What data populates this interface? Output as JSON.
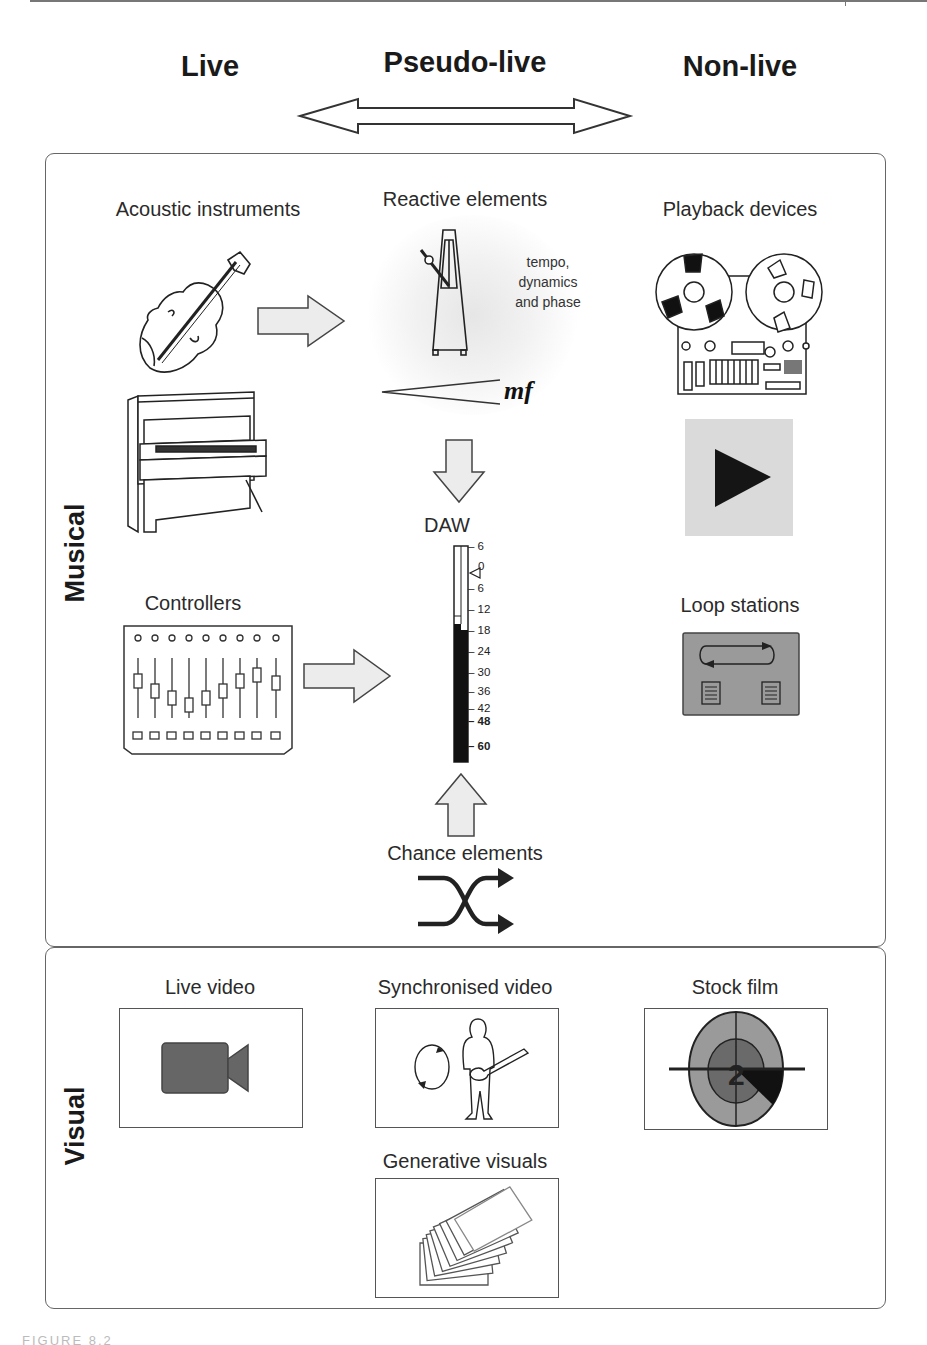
{
  "spectrum": {
    "left_label": "Live",
    "middle_label": "Pseudo-live",
    "right_label": "Non-live",
    "arrow_icon": "double-headed-arrow-icon"
  },
  "musical_panel": {
    "side_label": "Musical",
    "acoustic": {
      "caption": "Acoustic instruments",
      "icons": [
        "violin-icon",
        "upright-piano-icon"
      ]
    },
    "reactive": {
      "caption": "Reactive elements",
      "note_lines": [
        "tempo,",
        "dynamics",
        "and phase"
      ],
      "dynamic_mark": "mf",
      "icons": [
        "metronome-icon",
        "crescendo-hairpin-icon"
      ]
    },
    "playback": {
      "caption": "Playback devices",
      "icons": [
        "reel-to-reel-tape-icon",
        "play-button-icon"
      ]
    },
    "controllers": {
      "caption": "Controllers",
      "fader_count": 9,
      "icons": [
        "fader-controller-icon"
      ]
    },
    "daw": {
      "caption": "DAW",
      "meter_scale": [
        "6",
        "0",
        "6",
        "12",
        "18",
        "24",
        "30",
        "36",
        "42",
        "48",
        "60"
      ]
    },
    "loop_stations": {
      "caption": "Loop stations",
      "icons": [
        "loop-station-icon"
      ]
    },
    "chance": {
      "caption": "Chance elements",
      "icons": [
        "shuffle-icon"
      ]
    }
  },
  "visual_panel": {
    "side_label": "Visual",
    "live_video": {
      "caption": "Live video",
      "icon": "video-camera-icon"
    },
    "synchronised_video": {
      "caption": "Synchronised video",
      "icon": "guitarist-sync-icon"
    },
    "stock_film": {
      "caption": "Stock film",
      "countdown_number": "2",
      "icon": "film-countdown-leader-icon"
    },
    "generative_visuals": {
      "caption": "Generative visuals",
      "icon": "stacked-frames-icon"
    }
  },
  "footer": {
    "text": "FIGURE 8.2"
  },
  "colors": {
    "arrow_fill": "#ececec",
    "panel_border": "#666666",
    "dark_fill": "#1a1a1a",
    "mid_gray": "#777777",
    "light_gray": "#d9d9d9"
  }
}
